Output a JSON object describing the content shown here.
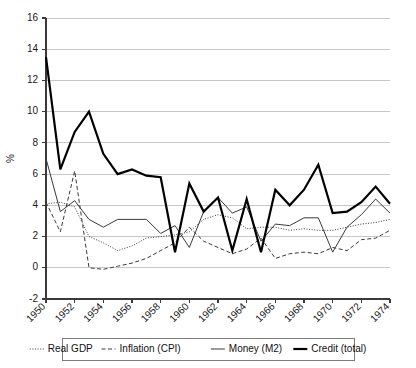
{
  "chart_data": {
    "type": "line",
    "title": "",
    "xlabel": "",
    "ylabel": "%",
    "xlim": [
      1950,
      1974
    ],
    "ylim": [
      -2,
      16
    ],
    "yticks": [
      -2,
      0,
      2,
      4,
      6,
      8,
      10,
      12,
      14,
      16
    ],
    "xticks": [
      1950,
      1952,
      1954,
      1956,
      1958,
      1960,
      1962,
      1964,
      1966,
      1968,
      1970,
      1972,
      1974
    ],
    "xtick_labels": [
      "1950",
      "1952",
      "1954",
      "1956",
      "1958",
      "1960",
      "1962",
      "1964",
      "1966",
      "1968",
      "1970",
      "1972",
      "1974"
    ],
    "ytick_labels": [
      "-2",
      "0",
      "2",
      "4",
      "6",
      "8",
      "10",
      "12",
      "14",
      "16"
    ],
    "grid": true,
    "grid_axis": "y",
    "legend_position": "bottom",
    "x": [
      1950,
      1951,
      1952,
      1953,
      1954,
      1955,
      1956,
      1957,
      1958,
      1959,
      1960,
      1961,
      1962,
      1963,
      1964,
      1965,
      1966,
      1967,
      1968,
      1969,
      1970,
      1971,
      1972,
      1973,
      1974
    ],
    "series": [
      {
        "name": "Real GDP",
        "style": "dotted",
        "color": "#3a3a3a",
        "width": 1.0,
        "dash": "1,1.6",
        "values": [
          4.1,
          4.2,
          3.9,
          2.0,
          1.6,
          1.1,
          1.4,
          1.9,
          2.0,
          2.1,
          2.3,
          3.1,
          3.4,
          3.2,
          2.5,
          2.6,
          2.6,
          2.4,
          2.5,
          2.4,
          2.4,
          2.6,
          2.8,
          2.9,
          3.1
        ]
      },
      {
        "name": "Inflation (CPI)",
        "style": "dashed",
        "color": "#3a3a3a",
        "width": 1.0,
        "dash": "4,2.5",
        "values": [
          4.2,
          2.3,
          6.2,
          0.0,
          -0.1,
          0.1,
          0.3,
          0.6,
          1.1,
          1.6,
          2.6,
          1.7,
          1.3,
          0.9,
          1.2,
          1.9,
          0.6,
          0.9,
          1.0,
          0.9,
          1.3,
          1.1,
          1.8,
          1.9,
          2.4
        ]
      },
      {
        "name": "Money (M2)",
        "style": "solid-thin",
        "color": "#3a3a3a",
        "width": 1.0,
        "dash": "",
        "values": [
          7.0,
          3.6,
          4.3,
          3.1,
          2.6,
          3.1,
          3.1,
          3.1,
          2.2,
          2.7,
          1.3,
          3.6,
          4.5,
          3.5,
          3.9,
          1.7,
          2.8,
          2.7,
          3.2,
          3.2,
          1.0,
          2.6,
          3.4,
          4.4,
          3.5
        ]
      },
      {
        "name": "Credit (total)",
        "style": "solid-thick",
        "color": "#000000",
        "width": 2.2,
        "dash": "",
        "values": [
          13.5,
          6.3,
          8.7,
          10.0,
          7.3,
          6.0,
          6.3,
          5.9,
          5.8,
          1.0,
          5.4,
          3.6,
          4.5,
          1.1,
          4.4,
          1.0,
          5.0,
          4.0,
          5.0,
          6.6,
          3.5,
          3.6,
          4.2,
          5.2,
          4.1
        ]
      }
    ],
    "legend_entries": [
      {
        "label": "Real GDP",
        "style": "dotted"
      },
      {
        "label": "Inflation (CPI)",
        "style": "dashed"
      },
      {
        "label": "Money (M2)",
        "style": "solid-thin"
      },
      {
        "label": "Credit (total)",
        "style": "solid-thick"
      }
    ]
  },
  "plot": {
    "left": 46,
    "right": 390,
    "top": 18,
    "bottom": 299,
    "xtick_label_rotation": -45
  },
  "legend": {
    "x": 62,
    "y": 338,
    "width": 292,
    "height": 22
  }
}
